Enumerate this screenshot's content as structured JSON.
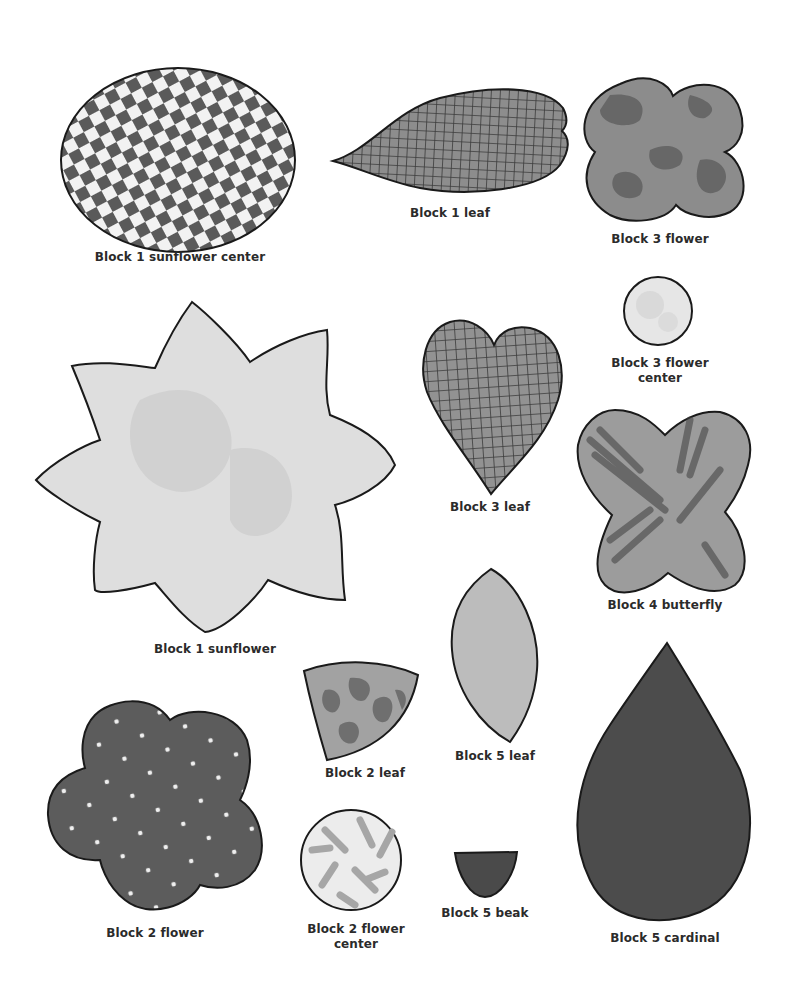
{
  "page": {
    "background": "#ffffff",
    "outline_color": "#1a1a1a"
  },
  "shapes": [
    {
      "id": "block1-sunflower-center",
      "label": "Block 1 sunflower center",
      "shape": "oval",
      "pattern": "checkerboard",
      "fill": "#5a5a5a",
      "accent": "#f2f2f2"
    },
    {
      "id": "block1-leaf",
      "label": "Block 1 leaf",
      "shape": "leaf-teardrop-horizontal",
      "pattern": "grid",
      "fill": "#8a8a8a",
      "accent": "#3a3a3a"
    },
    {
      "id": "block3-flower",
      "label": "Block 3 flower",
      "shape": "four-lobed-flower",
      "pattern": "mottled",
      "fill": "#8c8c8c",
      "accent": "#5e5e5e"
    },
    {
      "id": "block3-flower-center",
      "label_lines": [
        "Block 3 flower",
        "center"
      ],
      "shape": "circle",
      "pattern": "mottled-light",
      "fill": "#e4e4e4",
      "accent": "#cfcfcf"
    },
    {
      "id": "block1-sunflower",
      "label": "Block 1 sunflower",
      "shape": "eight-point-star",
      "pattern": "mottled-light",
      "fill": "#dcdcdc",
      "accent": "#c6c6c6"
    },
    {
      "id": "block3-leaf",
      "label": "Block 3 leaf",
      "shape": "heart",
      "pattern": "grid",
      "fill": "#8e8e8e",
      "accent": "#3a3a3a"
    },
    {
      "id": "block4-butterfly",
      "label": "Block 4 butterfly",
      "shape": "butterfly",
      "pattern": "streaked",
      "fill": "#9a9a9a",
      "accent": "#4a4a4a"
    },
    {
      "id": "block2-leaf",
      "label": "Block 2 leaf",
      "shape": "wedge",
      "pattern": "swirl",
      "fill": "#a0a0a0",
      "accent": "#666666"
    },
    {
      "id": "block5-leaf",
      "label": "Block 5 leaf",
      "shape": "almond",
      "pattern": "solid-speckled",
      "fill": "#b8b8b8",
      "accent": "#a8a8a8"
    },
    {
      "id": "block2-flower",
      "label": "Block 2 flower",
      "shape": "five-lobed-flower",
      "pattern": "polka-dot",
      "fill": "#5c5c5c",
      "accent": "#f0f0f0"
    },
    {
      "id": "block2-flower-center",
      "label_lines": [
        "Block 2 flower",
        "center"
      ],
      "shape": "circle",
      "pattern": "confetti",
      "fill": "#ececec",
      "accent": "#a6a6a6"
    },
    {
      "id": "block5-beak",
      "label": "Block 5 beak",
      "shape": "half-oval",
      "pattern": "solid",
      "fill": "#4a4a4a",
      "accent": "#3a3a3a"
    },
    {
      "id": "block5-cardinal",
      "label": "Block 5 cardinal",
      "shape": "teardrop",
      "pattern": "solid-speckled",
      "fill": "#4c4c4c",
      "accent": "#404040"
    }
  ]
}
